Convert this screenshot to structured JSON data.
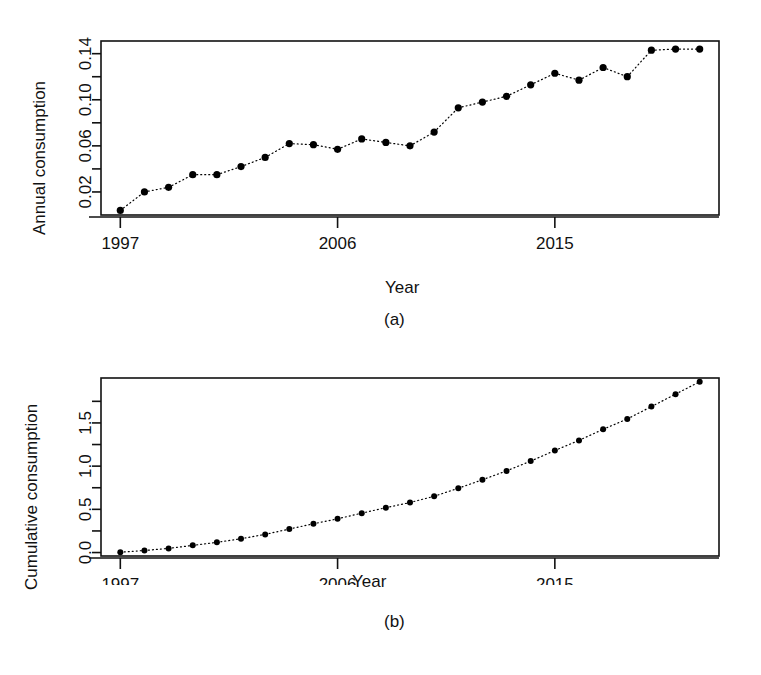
{
  "figure": {
    "background": "#ffffff",
    "foreground": "#111111",
    "point_color": "#000000",
    "line_style": "dotted"
  },
  "panels": [
    {
      "id": "a",
      "caption": "(a)",
      "xlabel": "Year",
      "ylabel": "Annual consumption"
    },
    {
      "id": "b",
      "caption": "(b)",
      "xlabel": "Year",
      "ylabel": "Cumulative consumption"
    }
  ],
  "chart_data": [
    {
      "type": "scatter",
      "panel": "a",
      "title": "",
      "xlabel": "Year",
      "ylabel": "Annual consumption",
      "xticklabels": [
        "1997",
        "2006",
        "2015"
      ],
      "xtickvalues": [
        1997,
        2006,
        2015
      ],
      "yticklabels": [
        "0.02",
        "0.06",
        "0.10",
        "0.14"
      ],
      "ytickvalues": [
        0.02,
        0.06,
        0.1,
        0.14
      ],
      "yminorticks": [
        0.04,
        0.08,
        0.12
      ],
      "xlim": [
        1996.2,
        2021.8
      ],
      "ylim": [
        0.0,
        0.151
      ],
      "grid": false,
      "legend": null,
      "marker": "filled-circle",
      "connector": "dotted",
      "x": [
        1997,
        1998,
        1999,
        2000,
        2001,
        2002,
        2003,
        2004,
        2005,
        2006,
        2007,
        2008,
        2009,
        2010,
        2011,
        2012,
        2013,
        2014,
        2015,
        2016,
        2017,
        2018,
        2019,
        2020,
        2021
      ],
      "values": [
        0.004,
        0.02,
        0.024,
        0.035,
        0.035,
        0.042,
        0.05,
        0.062,
        0.061,
        0.057,
        0.066,
        0.063,
        0.06,
        0.072,
        0.093,
        0.098,
        0.103,
        0.113,
        0.123,
        0.117,
        0.128,
        0.12,
        0.143,
        0.144,
        0.144
      ]
    },
    {
      "type": "scatter",
      "panel": "b",
      "title": "",
      "xlabel": "Year",
      "ylabel": "Cumulative consumption",
      "xticklabels": [
        "1997",
        "2006",
        "2015"
      ],
      "xtickvalues": [
        1997,
        2006,
        2015
      ],
      "yticklabels": [
        "0.0",
        "0.5",
        "1.0",
        "1.5"
      ],
      "ytickvalues": [
        0.0,
        0.5,
        1.0,
        1.5
      ],
      "yminorticks": [
        0.25,
        0.75,
        1.25,
        1.75
      ],
      "xlim": [
        1996.2,
        2021.8
      ],
      "ylim": [
        -0.04,
        2.02
      ],
      "grid": false,
      "legend": null,
      "marker": "filled-circle",
      "connector": "dotted",
      "x": [
        1997,
        1998,
        1999,
        2000,
        2001,
        2002,
        2003,
        2004,
        2005,
        2006,
        2007,
        2008,
        2009,
        2010,
        2011,
        2012,
        2013,
        2014,
        2015,
        2016,
        2017,
        2018,
        2019,
        2020,
        2021
      ],
      "values": [
        0.004,
        0.024,
        0.048,
        0.083,
        0.118,
        0.16,
        0.21,
        0.272,
        0.333,
        0.39,
        0.456,
        0.519,
        0.579,
        0.651,
        0.744,
        0.842,
        0.945,
        1.058,
        1.181,
        1.298,
        1.426,
        1.546,
        1.689,
        1.833,
        1.977
      ]
    }
  ]
}
